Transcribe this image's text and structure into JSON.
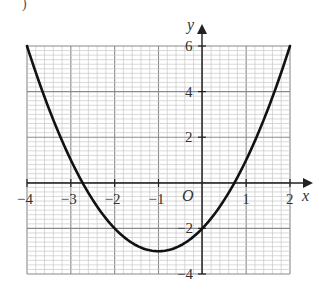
{
  "question": {
    "part_label": ")"
  },
  "chart_data": {
    "type": "line",
    "title": "",
    "xlabel": "x",
    "ylabel": "y",
    "origin_label": "O",
    "xlim": [
      -4,
      2
    ],
    "ylim": [
      -4,
      6
    ],
    "grid": true,
    "minor_grid_step": 0.2,
    "major_grid_step_x": 1,
    "major_grid_step_y": 2,
    "x_ticks": [
      "-4",
      "-3",
      "-2",
      "-1",
      "1",
      "2"
    ],
    "y_ticks": [
      "6",
      "4",
      "2",
      "-2",
      "-4"
    ],
    "series": [
      {
        "name": "y = x^2 + 2x - 2",
        "equation": "y = x^2 + 2x - 2",
        "x": [
          -4,
          -3.5,
          -3,
          -2.732,
          -2.5,
          -2,
          -1.5,
          -1,
          -0.5,
          0,
          0.5,
          0.732,
          1,
          1.5,
          2
        ],
        "y": [
          6,
          3.25,
          1,
          0,
          -0.75,
          -2,
          -2.75,
          -3,
          -2.75,
          -2,
          -0.75,
          0,
          1,
          3.25,
          6
        ]
      }
    ],
    "key_points": {
      "vertex": [
        -1,
        -3
      ],
      "y_intercept": [
        0,
        -2
      ],
      "x_intercepts": [
        -2.73,
        0.73
      ]
    },
    "colors": {
      "grid_minor": "#c8c8c8",
      "grid_major": "#8a8a8a",
      "axis": "#222222",
      "curve": "#111111"
    }
  }
}
